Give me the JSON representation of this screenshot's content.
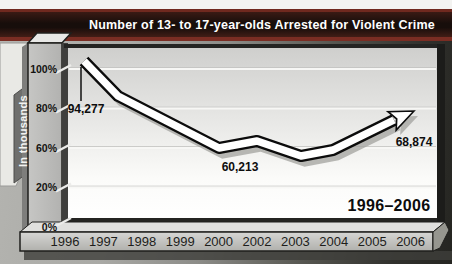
{
  "header": {
    "title": "Number of 13- to 17-year-olds Arrested for Violent Crime",
    "bar_color": "#170e0b",
    "accent_color": "#7a2d23"
  },
  "y_axis": {
    "unit_label": "In thousands",
    "tick_labels": [
      "100%",
      "80%",
      "60%",
      "20%",
      "0%"
    ]
  },
  "x_axis": {
    "tick_labels": [
      "1996",
      "1997",
      "1998",
      "1999",
      "2000",
      "2002",
      "2003",
      "2004",
      "2005",
      "2006"
    ]
  },
  "annotations": {
    "range_label": "1996–2006"
  },
  "chart_data": {
    "type": "line",
    "title": "Number of 13- to 17-year-olds Arrested for Violent Crime",
    "xlabel": "",
    "ylabel": "In thousands",
    "x_tick_labels": [
      "1996",
      "1997",
      "1998",
      "1999",
      "2000",
      "2002",
      "2003",
      "2004",
      "2005",
      "2006"
    ],
    "y_tick_labels": [
      "100%",
      "80%",
      "60%",
      "20%",
      "0%"
    ],
    "grid": true,
    "legend_position": "none",
    "range_label": "1996–2006",
    "labeled_points": [
      {
        "x_label": "1996",
        "value": 94277,
        "display": "94,277"
      },
      {
        "x_label": "dip (~2001)",
        "value": 60213,
        "display": "60,213"
      },
      {
        "x_label": "2006",
        "value": 68874,
        "display": "68,874"
      }
    ],
    "band_vertices_px": [
      [
        84,
        61
      ],
      [
        118,
        96
      ],
      [
        219,
        148
      ],
      [
        257,
        141
      ],
      [
        301,
        156
      ],
      [
        333,
        150
      ],
      [
        394,
        120
      ]
    ],
    "arrow_tip_px": [
      414,
      111
    ],
    "value_label_positions": [
      {
        "text": "94,277",
        "cx": 86,
        "cy": 109
      },
      {
        "text": "60,213",
        "cx": 240,
        "cy": 167
      },
      {
        "text": "68,874",
        "cx": 414,
        "cy": 142
      }
    ],
    "leader_line": {
      "x": 81,
      "y1": 67,
      "y2": 101
    },
    "band_color": "#ffffff",
    "band_outline_color": "#0c0c0c",
    "shadow_color": "#a2a29e"
  }
}
